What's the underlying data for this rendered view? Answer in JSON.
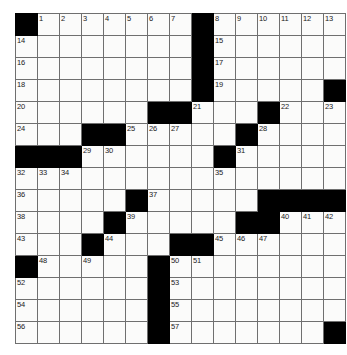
{
  "puzzle": {
    "type": "crossword-grid",
    "rows": 15,
    "cols": 15,
    "cell_size_px": 21,
    "colors": {
      "block": "#000000",
      "cell": "#fbfbfa",
      "grid_line": "#6f6f6f",
      "outer_border": "#4a4a4a",
      "number_text": "#1a1a1a"
    },
    "grid": [
      [
        {
          "block": true
        },
        {
          "num": "1"
        },
        {
          "num": "2"
        },
        {
          "num": "3"
        },
        {
          "num": "4"
        },
        {
          "num": "5"
        },
        {
          "num": "6"
        },
        {
          "num": "7"
        },
        {
          "block": true
        },
        {
          "num": "8"
        },
        {
          "num": "9"
        },
        {
          "num": "10"
        },
        {
          "num": "11"
        },
        {
          "num": "12"
        },
        {
          "num": "13"
        }
      ],
      [
        {
          "num": "14"
        },
        {},
        {},
        {},
        {},
        {},
        {},
        {},
        {
          "block": true
        },
        {
          "num": "15"
        },
        {},
        {},
        {},
        {},
        {}
      ],
      [
        {
          "num": "16"
        },
        {},
        {},
        {},
        {},
        {},
        {},
        {},
        {
          "block": true
        },
        {
          "num": "17"
        },
        {},
        {},
        {},
        {},
        {}
      ],
      [
        {
          "num": "18"
        },
        {},
        {},
        {},
        {},
        {},
        {},
        {},
        {
          "block": true
        },
        {
          "num": "19"
        },
        {},
        {},
        {},
        {},
        {
          "block": true
        }
      ],
      [
        {
          "num": "20"
        },
        {},
        {},
        {},
        {},
        {},
        {
          "block": true
        },
        {
          "block": true
        },
        {
          "num": "21"
        },
        {},
        {},
        {
          "block": true
        },
        {
          "num": "22"
        },
        {},
        {
          "num": "23"
        }
      ],
      [
        {
          "num": "24"
        },
        {},
        {},
        {
          "block": true
        },
        {
          "block": true
        },
        {
          "num": "25"
        },
        {
          "num": "26"
        },
        {
          "num": "27"
        },
        {},
        {},
        {
          "block": true
        },
        {
          "num": "28"
        },
        {},
        {},
        {}
      ],
      [
        {
          "block": true
        },
        {
          "block": true
        },
        {
          "block": true
        },
        {
          "num": "29"
        },
        {
          "num": "30"
        },
        {},
        {},
        {},
        {},
        {
          "block": true
        },
        {
          "num": "31"
        },
        {},
        {},
        {},
        {}
      ],
      [
        {
          "num": "32"
        },
        {
          "num": "33"
        },
        {
          "num": "34"
        },
        {},
        {},
        {},
        {},
        {},
        {},
        {
          "num": "35"
        },
        {},
        {},
        {},
        {},
        {}
      ],
      [
        {
          "num": "36"
        },
        {},
        {},
        {},
        {},
        {
          "block": true
        },
        {
          "num": "37"
        },
        {},
        {},
        {},
        {},
        {
          "block": true
        },
        {
          "block": true
        },
        {
          "block": true
        },
        {
          "block": true
        }
      ],
      [
        {
          "num": "38"
        },
        {},
        {},
        {},
        {
          "block": true
        },
        {
          "num": "39"
        },
        {},
        {},
        {},
        {},
        {
          "block": true
        },
        {
          "block": true
        },
        {
          "num": "40"
        },
        {
          "num": "41"
        },
        {
          "num": "42"
        }
      ],
      [
        {
          "num": "43"
        },
        {},
        {},
        {
          "block": true
        },
        {
          "num": "44"
        },
        {},
        {},
        {
          "block": true
        },
        {
          "block": true
        },
        {
          "num": "45"
        },
        {
          "num": "46"
        },
        {
          "num": "47"
        },
        {},
        {},
        {}
      ],
      [
        {
          "block": true
        },
        {
          "num": "48"
        },
        {},
        {
          "num": "49"
        },
        {},
        {},
        {
          "block": true
        },
        {
          "num": "50"
        },
        {
          "num": "51"
        },
        {},
        {},
        {},
        {},
        {},
        {}
      ],
      [
        {
          "num": "52"
        },
        {},
        {},
        {},
        {},
        {},
        {
          "block": true
        },
        {
          "num": "53"
        },
        {},
        {},
        {},
        {},
        {},
        {},
        {}
      ],
      [
        {
          "num": "54"
        },
        {},
        {},
        {},
        {},
        {},
        {
          "block": true
        },
        {
          "num": "55"
        },
        {},
        {},
        {},
        {},
        {},
        {},
        {}
      ],
      [
        {
          "num": "56"
        },
        {},
        {},
        {},
        {},
        {},
        {
          "block": true
        },
        {
          "num": "57"
        },
        {},
        {},
        {},
        {},
        {},
        {},
        {
          "block": true
        }
      ]
    ]
  }
}
